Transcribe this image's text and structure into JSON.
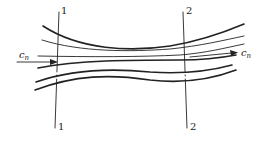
{
  "diagram": {
    "type": "streamtube",
    "sections": [
      {
        "id": "section-1",
        "top_label": "1",
        "bottom_label": "1"
      },
      {
        "id": "section-2",
        "top_label": "2",
        "bottom_label": "2"
      }
    ],
    "inlet_velocity": {
      "symbol": "c",
      "subscript": "n"
    },
    "outlet_velocity": {
      "symbol": "c",
      "subscript": "n"
    },
    "colors": {
      "line": "#222222",
      "background": "#ffffff"
    }
  }
}
